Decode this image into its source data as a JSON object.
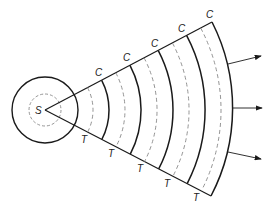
{
  "diagram": {
    "type": "wave-propagation-sector",
    "source_label": "S",
    "crest_label": "C",
    "trough_label": "T",
    "crest_labels": [
      "C",
      "C",
      "C",
      "C",
      "C"
    ],
    "trough_labels": [
      "T",
      "T",
      "T",
      "T",
      "T"
    ],
    "arrow_count": 3,
    "colors": {
      "line": "#1a1a1a",
      "dashed": "#888888",
      "background": "#ffffff"
    }
  }
}
